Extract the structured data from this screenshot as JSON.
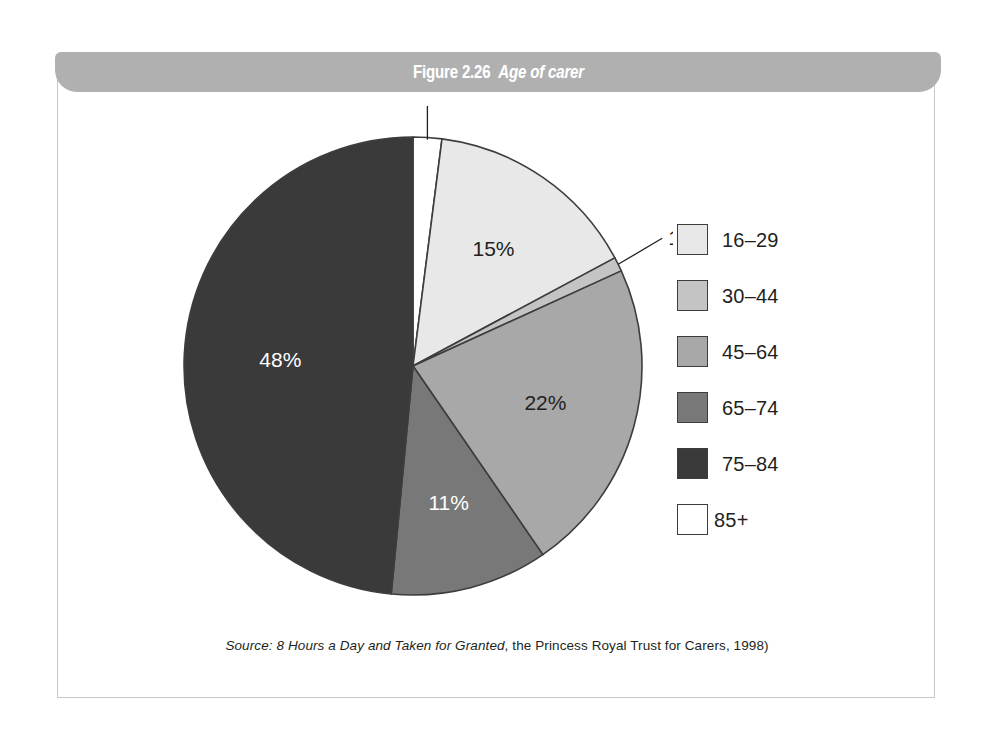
{
  "figure": {
    "title_number": "Figure 2.26",
    "title_name": "Age of carer",
    "source_prefix": "Source:",
    "source_italic": "8 Hours a Day and Taken for Granted",
    "source_rest": ", the Princess Royal Trust for Carers, 1998)"
  },
  "colors": {
    "title_bar": "#b0b0b0",
    "frame_border": "#c9c9c9",
    "outline": "#3d3d3d",
    "text": "#231f20",
    "slice_16_29": "#e8e8e8",
    "slice_30_44": "#c4c4c4",
    "slice_45_64": "#a8a8a8",
    "slice_65_74": "#787878",
    "slice_75_84": "#3a3a3a",
    "slice_85_plus": "#ffffff"
  },
  "legend": {
    "items": [
      {
        "label": "16–29",
        "color": "#e8e8e8"
      },
      {
        "label": "30–44",
        "color": "#c4c4c4"
      },
      {
        "label": "45–64",
        "color": "#a8a8a8"
      },
      {
        "label": "65–74",
        "color": "#787878"
      },
      {
        "label": "75–84",
        "color": "#3a3a3a"
      },
      {
        "label": "85+",
        "color": "#ffffff"
      }
    ]
  },
  "chart_data": {
    "type": "pie",
    "title": "Age of carer",
    "xlabel": "",
    "ylabel": "",
    "legend_position": "right",
    "grid": false,
    "units": "percent",
    "start_angle_deg": 0,
    "direction": "clockwise",
    "categories": [
      "85+",
      "16–29",
      "30–44",
      "45–64",
      "65–74",
      "75–84"
    ],
    "values": [
      2,
      15,
      1,
      22,
      11,
      48
    ],
    "slices": [
      {
        "label": "85+",
        "value": 2,
        "display": "2%",
        "color": "#ffffff",
        "label_color": "#231f20",
        "label_placement": "outside-leader"
      },
      {
        "label": "16–29",
        "value": 15,
        "display": "15%",
        "color": "#e8e8e8",
        "label_color": "#231f20",
        "label_placement": "inside"
      },
      {
        "label": "30–44",
        "value": 1,
        "display": "1%",
        "color": "#c4c4c4",
        "label_color": "#231f20",
        "label_placement": "outside-leader"
      },
      {
        "label": "45–64",
        "value": 22,
        "display": "22%",
        "color": "#a8a8a8",
        "label_color": "#231f20",
        "label_placement": "inside"
      },
      {
        "label": "65–74",
        "value": 11,
        "display": "11%",
        "color": "#787878",
        "label_color": "#ffffff",
        "label_placement": "inside"
      },
      {
        "label": "75–84",
        "value": 48,
        "display": "48%",
        "color": "#3a3a3a",
        "label_color": "#ffffff",
        "label_placement": "inside"
      }
    ],
    "labels": {
      "pct_2": "2%",
      "pct_15": "15%",
      "pct_1": "1%",
      "pct_22": "22%",
      "pct_11": "11%",
      "pct_48": "48%"
    }
  }
}
